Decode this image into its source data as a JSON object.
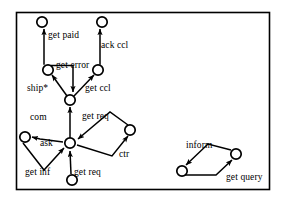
{
  "figure": {
    "type": "petri-net-diagram",
    "background_color": "#ffffff",
    "stroke_color": "#000000",
    "frame": {
      "x": 16,
      "y": 12,
      "width": 254,
      "height": 178
    },
    "labels": [
      {
        "id": "get-paid",
        "text": "get paid",
        "x": 48,
        "y": 31
      },
      {
        "id": "ack-ccl",
        "text": "ack ccl",
        "x": 101,
        "y": 41
      },
      {
        "id": "get-error",
        "text": "get error",
        "x": 56,
        "y": 61
      },
      {
        "id": "ship-star",
        "text": "ship*",
        "x": 27,
        "y": 84
      },
      {
        "id": "get-ccl",
        "text": "get ccl",
        "x": 85,
        "y": 84
      },
      {
        "id": "com",
        "text": "com",
        "x": 30,
        "y": 113
      },
      {
        "id": "get-req-1",
        "text": "get req",
        "x": 82,
        "y": 112
      },
      {
        "id": "ask",
        "text": "ask",
        "x": 40,
        "y": 139
      },
      {
        "id": "ctr",
        "text": "ctr",
        "x": 119,
        "y": 150
      },
      {
        "id": "get-inf",
        "text": "get inf",
        "x": 25,
        "y": 168
      },
      {
        "id": "get-req-2",
        "text": "get req",
        "x": 74,
        "y": 168
      },
      {
        "id": "inform",
        "text": "inform",
        "x": 186,
        "y": 141
      },
      {
        "id": "get-query",
        "text": "get query",
        "x": 226,
        "y": 173
      }
    ],
    "nodes": [
      {
        "id": "n-top-left",
        "cx": 42,
        "cy": 22,
        "r": 5.2
      },
      {
        "id": "n-top-right",
        "cx": 102,
        "cy": 22,
        "r": 5.2
      },
      {
        "id": "n-mid-left",
        "cx": 48,
        "cy": 70,
        "r": 5.2
      },
      {
        "id": "n-mid-right",
        "cx": 98,
        "cy": 70,
        "r": 5.2
      },
      {
        "id": "n-junction",
        "cx": 70,
        "cy": 100,
        "r": 5.2
      },
      {
        "id": "n-hub",
        "cx": 70,
        "cy": 143,
        "r": 5.2
      },
      {
        "id": "n-com",
        "cx": 25,
        "cy": 137,
        "r": 5.2
      },
      {
        "id": "n-ctr",
        "cx": 130,
        "cy": 130,
        "r": 5.2
      },
      {
        "id": "n-bottom",
        "cx": 72,
        "cy": 180,
        "r": 5.2
      },
      {
        "id": "n-right-left",
        "cx": 182,
        "cy": 171,
        "r": 5.2
      },
      {
        "id": "n-right-right",
        "cx": 236,
        "cy": 154,
        "r": 5.2
      }
    ],
    "edges": [
      {
        "id": "e-get-paid",
        "from": "n-mid-left",
        "to": "n-top-left",
        "label": "get paid"
      },
      {
        "id": "e-ack-ccl",
        "from": "n-mid-right",
        "to": "n-top-right",
        "label": "ack ccl"
      },
      {
        "id": "e-get-error",
        "from": "n-mid-left",
        "to": "n-junction",
        "label": "get error"
      },
      {
        "id": "e-ship-star",
        "from": "n-junction",
        "to": "n-mid-left",
        "label": "ship*"
      },
      {
        "id": "e-get-ccl",
        "from": "n-junction",
        "to": "n-mid-right",
        "label": "get ccl"
      },
      {
        "id": "e-up-trunk",
        "from": "n-hub",
        "to": "n-junction",
        "label": ""
      },
      {
        "id": "e-get-req-in",
        "from": "n-ctr",
        "to": "n-hub",
        "label": "get req"
      },
      {
        "id": "e-ctr-out",
        "from": "n-hub",
        "to": "n-ctr",
        "label": "ctr"
      },
      {
        "id": "e-com",
        "from": "n-hub",
        "to": "n-com",
        "label": "com"
      },
      {
        "id": "e-get-inf",
        "from": "n-com",
        "to": "n-hub",
        "label": "get inf"
      },
      {
        "id": "e-get-req-2",
        "from": "n-bottom",
        "to": "n-hub",
        "label": "get req"
      },
      {
        "id": "e-inform",
        "from": "n-right-right",
        "to": "n-right-left",
        "label": "inform"
      },
      {
        "id": "e-get-query",
        "from": "n-right-left",
        "to": "n-right-right",
        "label": "get query"
      }
    ]
  }
}
